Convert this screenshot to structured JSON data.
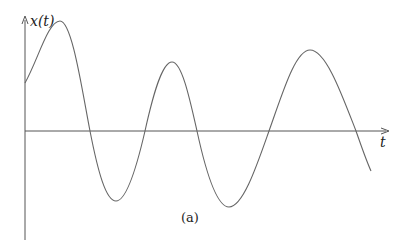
{
  "figure": {
    "y_axis_label": "x(t)",
    "x_axis_label": "t",
    "caption": "(a)",
    "colors": {
      "axis": "#555555",
      "curve": "#666666",
      "text": "#222222"
    }
  },
  "curve_points": [
    [
      25,
      83
    ],
    [
      60,
      21
    ],
    [
      90,
      131
    ],
    [
      116,
      201
    ],
    [
      145,
      131
    ],
    [
      172,
      62
    ],
    [
      197,
      131
    ],
    [
      229,
      207
    ],
    [
      269,
      131
    ],
    [
      310,
      50
    ],
    [
      356,
      131
    ],
    [
      371,
      171
    ]
  ]
}
